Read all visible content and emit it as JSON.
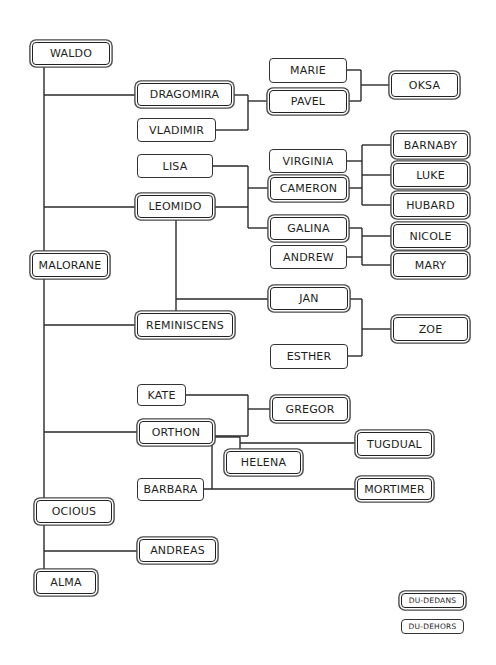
{
  "diagram": {
    "type": "family-tree",
    "nodes": [
      {
        "id": "waldo",
        "label": "WALDO",
        "style": "outer",
        "x": 32,
        "y": 42,
        "w": 78,
        "h": 23
      },
      {
        "id": "dragomira",
        "label": "DRAGOMIRA",
        "style": "outer",
        "x": 137,
        "y": 83,
        "w": 95,
        "h": 23
      },
      {
        "id": "vladimir",
        "label": "VLADIMIR",
        "style": "inner",
        "x": 137,
        "y": 118,
        "w": 79,
        "h": 24
      },
      {
        "id": "marie",
        "label": "MARIE",
        "style": "inner",
        "x": 269,
        "y": 58,
        "w": 78,
        "h": 25
      },
      {
        "id": "pavel",
        "label": "PAVEL",
        "style": "outer",
        "x": 269,
        "y": 90,
        "w": 78,
        "h": 23
      },
      {
        "id": "oksa",
        "label": "OKSA",
        "style": "outer",
        "x": 391,
        "y": 73,
        "w": 67,
        "h": 24
      },
      {
        "id": "lisa",
        "label": "LISA",
        "style": "inner",
        "x": 137,
        "y": 154,
        "w": 76,
        "h": 24
      },
      {
        "id": "leomido",
        "label": "LEOMIDO",
        "style": "outer",
        "x": 137,
        "y": 195,
        "w": 76,
        "h": 23
      },
      {
        "id": "virginia",
        "label": "VIRGINIA",
        "style": "inner",
        "x": 269,
        "y": 149,
        "w": 78,
        "h": 24
      },
      {
        "id": "cameron",
        "label": "CAMERON",
        "style": "outer",
        "x": 270,
        "y": 177,
        "w": 77,
        "h": 23
      },
      {
        "id": "barnaby",
        "label": "BARNABY",
        "style": "outer",
        "x": 393,
        "y": 133,
        "w": 75,
        "h": 24
      },
      {
        "id": "luke",
        "label": "LUKE",
        "style": "outer",
        "x": 393,
        "y": 163,
        "w": 75,
        "h": 24
      },
      {
        "id": "hubard",
        "label": "HUBARD",
        "style": "outer",
        "x": 393,
        "y": 193,
        "w": 75,
        "h": 24
      },
      {
        "id": "malorane",
        "label": "MALORANE",
        "style": "outer",
        "x": 32,
        "y": 253,
        "w": 76,
        "h": 24
      },
      {
        "id": "galina",
        "label": "GALINA",
        "style": "outer",
        "x": 270,
        "y": 217,
        "w": 77,
        "h": 23
      },
      {
        "id": "andrew",
        "label": "ANDREW",
        "style": "inner",
        "x": 270,
        "y": 245,
        "w": 77,
        "h": 24
      },
      {
        "id": "nicole",
        "label": "NICOLE",
        "style": "outer",
        "x": 393,
        "y": 224,
        "w": 75,
        "h": 24
      },
      {
        "id": "mary",
        "label": "MARY",
        "style": "outer",
        "x": 393,
        "y": 253,
        "w": 75,
        "h": 24
      },
      {
        "id": "jan",
        "label": "JAN",
        "style": "outer",
        "x": 270,
        "y": 287,
        "w": 78,
        "h": 23
      },
      {
        "id": "reminiscens",
        "label": "REMINISCENS",
        "style": "outer",
        "x": 137,
        "y": 313,
        "w": 96,
        "h": 24
      },
      {
        "id": "esther",
        "label": "ESTHER",
        "style": "inner",
        "x": 270,
        "y": 344,
        "w": 78,
        "h": 25
      },
      {
        "id": "zoe",
        "label": "ZOE",
        "style": "outer",
        "x": 393,
        "y": 317,
        "w": 75,
        "h": 24
      },
      {
        "id": "kate",
        "label": "KATE",
        "style": "inner",
        "x": 137,
        "y": 384,
        "w": 49,
        "h": 22
      },
      {
        "id": "gregor",
        "label": "GREGOR",
        "style": "outer",
        "x": 272,
        "y": 397,
        "w": 76,
        "h": 24
      },
      {
        "id": "orthon",
        "label": "ORTHON",
        "style": "outer",
        "x": 139,
        "y": 421,
        "w": 74,
        "h": 23
      },
      {
        "id": "tugdual",
        "label": "TUGDUAL",
        "style": "outer",
        "x": 357,
        "y": 432,
        "w": 75,
        "h": 24
      },
      {
        "id": "helena",
        "label": "HELENA",
        "style": "outer",
        "x": 226,
        "y": 451,
        "w": 75,
        "h": 23
      },
      {
        "id": "barbara",
        "label": "BARBARA",
        "style": "inner",
        "x": 137,
        "y": 478,
        "w": 67,
        "h": 23
      },
      {
        "id": "mortimer",
        "label": "MORTIMER",
        "style": "outer",
        "x": 357,
        "y": 478,
        "w": 75,
        "h": 22
      },
      {
        "id": "ocious",
        "label": "OCIOUS",
        "style": "outer",
        "x": 36,
        "y": 500,
        "w": 76,
        "h": 23
      },
      {
        "id": "andreas",
        "label": "ANDREAS",
        "style": "outer",
        "x": 139,
        "y": 539,
        "w": 77,
        "h": 23
      },
      {
        "id": "alma",
        "label": "ALMA",
        "style": "outer",
        "x": 36,
        "y": 571,
        "w": 60,
        "h": 23
      }
    ],
    "edges": [
      [
        44,
        65,
        44,
        571
      ],
      [
        44,
        95,
        137,
        95
      ],
      [
        44,
        207,
        137,
        207
      ],
      [
        44,
        325,
        137,
        325
      ],
      [
        44,
        432,
        139,
        432
      ],
      [
        44,
        551,
        139,
        551
      ],
      [
        232,
        95,
        248,
        95
      ],
      [
        216,
        130,
        248,
        130
      ],
      [
        248,
        95,
        248,
        130
      ],
      [
        248,
        101,
        269,
        101
      ],
      [
        347,
        70,
        361,
        70
      ],
      [
        347,
        101,
        361,
        101
      ],
      [
        361,
        70,
        361,
        101
      ],
      [
        361,
        85,
        391,
        85
      ],
      [
        213,
        166,
        248,
        166
      ],
      [
        213,
        207,
        248,
        207
      ],
      [
        248,
        166,
        248,
        228
      ],
      [
        248,
        188,
        270,
        188
      ],
      [
        248,
        228,
        270,
        228
      ],
      [
        347,
        161,
        362,
        161
      ],
      [
        347,
        188,
        362,
        188
      ],
      [
        362,
        145,
        362,
        205
      ],
      [
        362,
        145,
        393,
        145
      ],
      [
        362,
        175,
        393,
        175
      ],
      [
        362,
        205,
        393,
        205
      ],
      [
        347,
        228,
        362,
        228
      ],
      [
        347,
        257,
        362,
        257
      ],
      [
        362,
        228,
        362,
        265
      ],
      [
        362,
        236,
        393,
        236
      ],
      [
        362,
        265,
        393,
        265
      ],
      [
        176,
        218,
        176,
        313
      ],
      [
        176,
        299,
        270,
        299
      ],
      [
        348,
        299,
        362,
        299
      ],
      [
        348,
        356,
        362,
        356
      ],
      [
        362,
        299,
        362,
        356
      ],
      [
        362,
        329,
        393,
        329
      ],
      [
        186,
        395,
        248,
        395
      ],
      [
        213,
        436,
        248,
        436
      ],
      [
        248,
        395,
        248,
        436
      ],
      [
        248,
        409,
        272,
        409
      ],
      [
        213,
        437,
        240,
        437
      ],
      [
        240,
        437,
        240,
        451
      ],
      [
        240,
        443,
        357,
        443
      ],
      [
        212,
        444,
        212,
        489
      ],
      [
        204,
        489,
        357,
        489
      ]
    ],
    "legend": [
      {
        "label": "DU-DEDANS",
        "style": "outer"
      },
      {
        "label": "DU-DEHORS",
        "style": "inner"
      }
    ]
  }
}
